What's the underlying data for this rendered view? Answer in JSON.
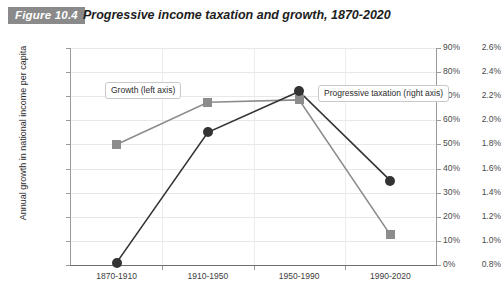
{
  "header": {
    "figure_badge": "Figure 10.4",
    "title": "Progressive income taxation and growth, 1870-2020"
  },
  "chart_data": {
    "type": "line",
    "title": "Progressive income taxation and growth, 1870-2020",
    "xlabel": "",
    "categories": [
      "1870-1910",
      "1910-1950",
      "1950-1990",
      "1990-2020"
    ],
    "grid": true,
    "legend_position": "inline-callout",
    "axes": {
      "left": {
        "label": "Annual growth in national income per capita",
        "ylim": [
          0.8,
          2.6
        ],
        "tick_step": 0.2,
        "ticks": [
          "0.8%",
          "1.0%",
          "1.2%",
          "1.4%",
          "1.6%",
          "1.8%",
          "2.0%",
          "2.2%",
          "2.4%",
          "2.6%"
        ],
        "tick_values": [
          0.8,
          1.0,
          1.2,
          1.4,
          1.6,
          1.8,
          2.0,
          2.2,
          2.4,
          2.6
        ]
      },
      "right": {
        "label": "Top marginal tax rate",
        "ylim": [
          0,
          90
        ],
        "tick_step": 10,
        "ticks": [
          "0%",
          "10%",
          "20%",
          "30%",
          "40%",
          "50%",
          "60%",
          "70%",
          "80%",
          "90%"
        ],
        "tick_values": [
          0,
          10,
          20,
          30,
          40,
          50,
          60,
          70,
          80,
          90
        ]
      }
    },
    "series": [
      {
        "name": "Growth (left axis)",
        "axis": "left",
        "color": "#8c8c8c",
        "marker": "square",
        "values": [
          1.8,
          2.15,
          2.17,
          1.05
        ]
      },
      {
        "name": "Progressive taxation (right axis)",
        "axis": "right",
        "color": "#333333",
        "marker": "circle",
        "values": [
          1,
          55,
          72,
          35
        ]
      }
    ],
    "annotations": [
      {
        "text": "Growth (left axis)",
        "target_series": "Growth (left axis)"
      },
      {
        "text": "Progressive taxation (right axis)",
        "target_series": "Progressive taxation (right axis)"
      }
    ]
  },
  "colors": {
    "badge": "#8a8a8a",
    "growth_series": "#8c8c8c",
    "tax_series": "#333333",
    "grid": "#e8e8e8",
    "axis": "#9a9a9a"
  }
}
